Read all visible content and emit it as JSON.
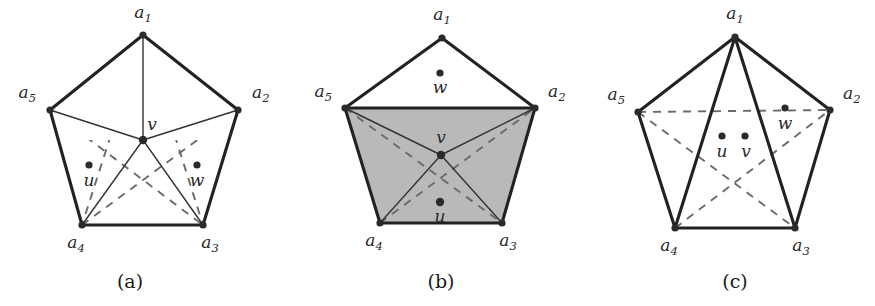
{
  "figure": {
    "type": "geometry-diagram",
    "background_color": "#ffffff",
    "stroke_color": "#222222",
    "thin_stroke_color": "#333333",
    "dashed_color": "#6a6a6a",
    "shade_color": "#b9b9b9",
    "vertex_dot_color": "#2b2b2b"
  },
  "panels": [
    {
      "id": "a",
      "caption": "(a)",
      "caption_pos": {
        "x": 130,
        "y": 288
      },
      "pentagon_vertices": [
        {
          "name": "a1",
          "label": "a",
          "sub": "1",
          "x": 143,
          "y": 35,
          "lx": 143,
          "ly": 18,
          "anchor": "middle"
        },
        {
          "name": "a2",
          "label": "a",
          "sub": "2",
          "x": 238,
          "y": 110,
          "lx": 252,
          "ly": 98,
          "anchor": "start"
        },
        {
          "name": "a3",
          "label": "a",
          "sub": "3",
          "x": 203,
          "y": 225,
          "lx": 210,
          "ly": 248,
          "anchor": "middle"
        },
        {
          "name": "a4",
          "label": "a",
          "sub": "4",
          "x": 82,
          "y": 225,
          "lx": 76,
          "ly": 248,
          "anchor": "middle"
        },
        {
          "name": "a5",
          "label": "a",
          "sub": "5",
          "x": 50,
          "y": 110,
          "lx": 36,
          "ly": 98,
          "anchor": "end"
        }
      ],
      "interior_points": [
        {
          "name": "v",
          "label": "v",
          "x": 143,
          "y": 140,
          "lx": 152,
          "ly": 130,
          "dot": true,
          "big": true
        },
        {
          "name": "u",
          "label": "u",
          "x": 89,
          "y": 165,
          "lx": 89,
          "ly": 186,
          "dot": true,
          "big": false
        },
        {
          "name": "w",
          "label": "w",
          "x": 197,
          "y": 165,
          "lx": 197,
          "ly": 186,
          "dot": true,
          "big": false
        }
      ],
      "thick_edges": [
        [
          "a1",
          "a2"
        ],
        [
          "a2",
          "a3"
        ],
        [
          "a3",
          "a4"
        ],
        [
          "a4",
          "a5"
        ],
        [
          "a5",
          "a1"
        ]
      ],
      "thin_edges": [
        [
          "a1",
          "v"
        ],
        [
          "a5",
          "v"
        ],
        [
          "a2",
          "v"
        ],
        [
          "a4",
          "v"
        ],
        [
          "a3",
          "v"
        ]
      ],
      "dashed_edges": [
        [
          "a5",
          "a3"
        ],
        [
          "a5",
          "a2"
        ],
        [
          "a4",
          "a2"
        ],
        [
          "a4",
          "a3"
        ],
        [
          "a1",
          "a3"
        ],
        [
          "a1",
          "a4"
        ]
      ],
      "dashed_clip": "pentagram",
      "shaded_regions": []
    },
    {
      "id": "b",
      "caption": "(b)",
      "caption_pos": {
        "x": 441,
        "y": 288
      },
      "pentagon_vertices": [
        {
          "name": "a1",
          "label": "a",
          "sub": "1",
          "x": 442,
          "y": 38,
          "lx": 442,
          "ly": 20,
          "anchor": "middle"
        },
        {
          "name": "a2",
          "label": "a",
          "sub": "2",
          "x": 535,
          "y": 108,
          "lx": 548,
          "ly": 97,
          "anchor": "start"
        },
        {
          "name": "a3",
          "label": "a",
          "sub": "3",
          "x": 502,
          "y": 223,
          "lx": 508,
          "ly": 246,
          "anchor": "middle"
        },
        {
          "name": "a4",
          "label": "a",
          "sub": "4",
          "x": 380,
          "y": 223,
          "lx": 374,
          "ly": 246,
          "anchor": "middle"
        },
        {
          "name": "a5",
          "label": "a",
          "sub": "5",
          "x": 345,
          "y": 108,
          "lx": 332,
          "ly": 97,
          "anchor": "end"
        }
      ],
      "interior_points": [
        {
          "name": "v",
          "label": "v",
          "x": 441,
          "y": 155,
          "lx": 441,
          "ly": 143,
          "dot": true,
          "big": true
        },
        {
          "name": "u",
          "label": "u",
          "x": 440,
          "y": 202,
          "lx": 440,
          "ly": 222,
          "dot": true,
          "big": true
        },
        {
          "name": "w",
          "label": "w",
          "x": 440,
          "y": 73,
          "lx": 440,
          "ly": 93,
          "dot": true,
          "big": false
        }
      ],
      "thick_edges": [
        [
          "a1",
          "a2"
        ],
        [
          "a2",
          "a3"
        ],
        [
          "a3",
          "a4"
        ],
        [
          "a4",
          "a5"
        ],
        [
          "a5",
          "a1"
        ],
        [
          "a5",
          "a2"
        ]
      ],
      "thin_edges": [
        [
          "a5",
          "v"
        ],
        [
          "a2",
          "v"
        ],
        [
          "a4",
          "v"
        ],
        [
          "a3",
          "v"
        ]
      ],
      "dashed_edges": [
        [
          "a5",
          "a3"
        ],
        [
          "a4",
          "a2"
        ]
      ],
      "dashed_clip": "none",
      "shaded_regions": [
        [
          "a5",
          "a2",
          "a3",
          "a4"
        ]
      ]
    },
    {
      "id": "c",
      "caption": "(c)",
      "caption_pos": {
        "x": 735,
        "y": 288
      },
      "pentagon_vertices": [
        {
          "name": "a1",
          "label": "a",
          "sub": "1",
          "x": 735,
          "y": 37,
          "lx": 735,
          "ly": 19,
          "anchor": "middle"
        },
        {
          "name": "a2",
          "label": "a",
          "sub": "2",
          "x": 830,
          "y": 110,
          "lx": 843,
          "ly": 99,
          "anchor": "start"
        },
        {
          "name": "a3",
          "label": "a",
          "sub": "3",
          "x": 795,
          "y": 228,
          "lx": 801,
          "ly": 251,
          "anchor": "middle"
        },
        {
          "name": "a4",
          "label": "a",
          "sub": "4",
          "x": 675,
          "y": 228,
          "lx": 669,
          "ly": 251,
          "anchor": "middle"
        },
        {
          "name": "a5",
          "label": "a",
          "sub": "5",
          "x": 638,
          "y": 112,
          "lx": 625,
          "ly": 100,
          "anchor": "end"
        }
      ],
      "interior_points": [
        {
          "name": "u",
          "label": "u",
          "x": 722,
          "y": 136,
          "lx": 722,
          "ly": 157,
          "dot": true,
          "big": false
        },
        {
          "name": "v",
          "label": "v",
          "x": 745,
          "y": 136,
          "lx": 746,
          "ly": 157,
          "dot": true,
          "big": false
        },
        {
          "name": "w",
          "label": "w",
          "x": 785,
          "y": 108,
          "lx": 785,
          "ly": 129,
          "dot": true,
          "big": false
        }
      ],
      "thick_edges": [
        [
          "a1",
          "a2"
        ],
        [
          "a2",
          "a3"
        ],
        [
          "a3",
          "a4"
        ],
        [
          "a4",
          "a5"
        ],
        [
          "a5",
          "a1"
        ],
        [
          "a1",
          "a4"
        ],
        [
          "a1",
          "a3"
        ]
      ],
      "thin_edges": [],
      "dashed_edges": [
        [
          "a5",
          "a3"
        ],
        [
          "a5",
          "a2"
        ],
        [
          "a4",
          "a2"
        ],
        [
          "a4",
          "a3"
        ]
      ],
      "dashed_clip": "none",
      "shaded_regions": []
    }
  ]
}
